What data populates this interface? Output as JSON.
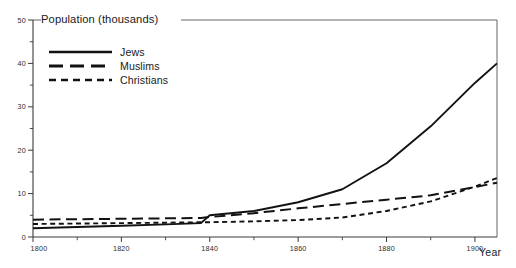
{
  "chart_data": {
    "type": "line",
    "title": "Population (thousands)",
    "xlabel": "Year",
    "ylabel": "Population (thousands)",
    "xlim": [
      1800,
      1905
    ],
    "ylim": [
      0,
      50
    ],
    "grid": false,
    "legend_position": "top-left",
    "x_ticks": [
      "1800",
      "1820",
      "1840",
      "1860",
      "1880",
      "1900"
    ],
    "x_tick_values": [
      1800,
      1820,
      1840,
      1860,
      1880,
      1900
    ],
    "x_minor_tick_values": [
      1810,
      1830,
      1850,
      1870,
      1890
    ],
    "y_ticks": [
      "0",
      "10",
      "20",
      "30",
      "40",
      "50"
    ],
    "y_tick_values": [
      0,
      10,
      20,
      30,
      40,
      50
    ],
    "y_minor_tick_values": [
      5,
      15,
      25,
      35,
      45
    ],
    "x": [
      1800,
      1810,
      1820,
      1830,
      1838,
      1840,
      1850,
      1860,
      1870,
      1880,
      1890,
      1900,
      1905
    ],
    "series": [
      {
        "name": "Jews",
        "style": "solid",
        "values": [
          2.0,
          2.3,
          2.6,
          2.9,
          3.2,
          5.0,
          6.0,
          8.0,
          11.0,
          17.0,
          25.5,
          35.5,
          40.0
        ]
      },
      {
        "name": "Muslims",
        "style": "long-dash",
        "values": [
          4.0,
          4.1,
          4.2,
          4.3,
          4.4,
          4.6,
          5.5,
          6.6,
          7.6,
          8.6,
          9.6,
          11.5,
          12.5
        ]
      },
      {
        "name": "Christians",
        "style": "short-dash",
        "values": [
          3.0,
          3.1,
          3.2,
          3.3,
          3.4,
          3.4,
          3.6,
          3.9,
          4.5,
          6.0,
          8.2,
          11.6,
          13.6
        ]
      }
    ]
  },
  "legend": {
    "entries": [
      {
        "label": "Jews"
      },
      {
        "label": "Muslims"
      },
      {
        "label": "Christians"
      }
    ]
  },
  "colors": {
    "ink": "#121212",
    "axis": "#3a3a3a",
    "background": "#ffffff"
  }
}
